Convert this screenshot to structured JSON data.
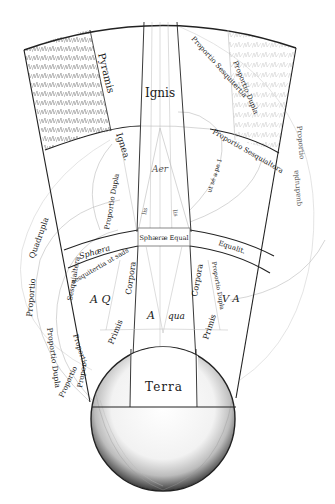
{
  "figure": {
    "colors": {
      "ink": "#222222",
      "paper": "#ffffff",
      "hatch": "#9a9a9a",
      "faint": "#bbbbbb"
    }
  },
  "regions": {
    "ignis": "Ignis",
    "aer": "Aer",
    "aqua_a": "A",
    "aqua_qua": "qua",
    "terra": "Terra"
  },
  "labels": {
    "pyramis": "Pyramis",
    "ignea": "Ignea.",
    "proportio_dupla_top": "Proportio Dupla",
    "proportio_sesquitertia_top": "Proportio Sesquitertia",
    "proportio_sesquialtera": "Proportio Sesquialtera",
    "ut_seq_right": "ut sé a pe 1",
    "proportio_dupla_inner": "Proportio Dupla",
    "proportio_quadrupla_right_1": "Proportio",
    "proportio_quadrupla_right_2": "quadrupla",
    "li_left": "lis",
    "li_right": "lis",
    "sphaera_equal": "Sphæræ Equal",
    "sphaera": "Sphæra",
    "equalit": "Equalit.",
    "sesquitertia_ut_sads": "sesquitertia ut sads",
    "corpora_left": "Corpora",
    "corpora_right": "Corpora",
    "primis_left": "Primis",
    "primis_right": "Primis",
    "aq_left": "A Q",
    "va_right": "V A",
    "proportio_right_mid": "Proportio Dupla",
    "proportio_quadrupla_left_1": "Quadrupla",
    "proportio_quadrupla_left_2": "Proportio",
    "proportio_dupla_left": "Proportio Dupla",
    "proportio_sesquialtera_left": "Sesquialtera",
    "proportio_left_small": "Proportio",
    "proportio_left_bottom_1": "Propor-",
    "proportio_left_bottom_2": "Proportio"
  }
}
